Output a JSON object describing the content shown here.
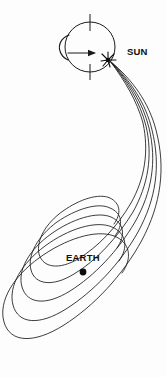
{
  "figure": {
    "width": 167,
    "height": 377,
    "background_color": "#fdfdfd",
    "line_color": "#1a1a1a",
    "label_color": "#111111"
  },
  "labels": {
    "sun": "SUN",
    "earth": "EARTH"
  },
  "sun": {
    "label": "SUN",
    "center_x": 90,
    "center_y": 47,
    "radius": 25,
    "label_x": 127,
    "label_y": 55,
    "rotation_axis_top_y": 14,
    "rotation_axis_bottom_y": 80,
    "rotation_arrow_label": "rotation-direction"
  },
  "flare": {
    "origin_x": 108,
    "origin_y": 60,
    "ray_count": 8,
    "glyph": "starburst"
  },
  "earth": {
    "label": "EARTH",
    "label_x": 67,
    "label_y": 261,
    "dot_x": 83,
    "dot_y": 271,
    "dot_radius": 3.4
  },
  "field_lines": {
    "count": 5,
    "description": "Nested teardrop loops emanating from the solar flare point and wrapping around Earth",
    "paths": [
      "M110,61 C128,86 142,112 148,140 C156,176 150,206 131,236 C113,264 90,286 68,298 C46,310 28,305 22,288 C16,270 26,252 44,238 C63,223 86,215 101,220 C113,224 116,236 108,248",
      "M110,61 C132,88 148,116 154,146 C163,184 156,218 134,252 C114,282 88,308 62,322 C36,335 15,329 9,309 C3,289 15,267 36,251 C58,234 85,225 102,231 C117,236 121,250 112,264",
      "M110,61 C124,84 136,108 141,134 C148,168 143,196 126,223 C110,249 89,269 70,280 C51,290 36,286 31,271 C26,256 35,240 51,228 C68,216 88,210 101,214 C111,217 114,227 107,237",
      "M110,61 C120,82 130,104 134,128 C140,159 136,185 121,210 C107,234 89,252 72,262 C56,271 43,268 39,255 C35,242 43,228 57,217 C72,206 90,201 101,205 C110,208 112,217 106,226",
      "M110,61 C116,80 124,100 127,122 C132,150 129,174 116,197 C104,219 89,236 74,245 C60,253 49,250 46,239 C43,228 50,216 62,206 C75,196 91,192 101,196 C109,199 111,207 105,215"
    ]
  }
}
